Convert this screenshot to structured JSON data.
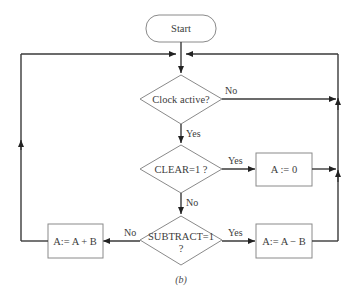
{
  "diagram": {
    "caption": "(b)",
    "nodes": {
      "start": "Start",
      "clock": "Clock active?",
      "clear": "CLEAR=1 ?",
      "subtract_line1": "SUBTRACT=1",
      "subtract_line2": "?",
      "a_zero": "A := 0",
      "a_minus": "A:= A − B",
      "a_plus": "A:= A + B"
    },
    "edges": {
      "clock_no": "No",
      "clock_yes": "Yes",
      "clear_yes": "Yes",
      "clear_no": "No",
      "subtract_yes": "Yes",
      "subtract_no": "No"
    }
  }
}
